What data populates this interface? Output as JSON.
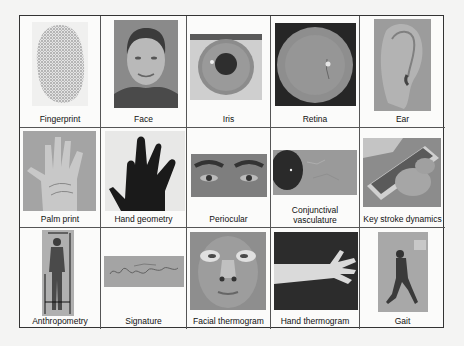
{
  "figure": {
    "type": "biometric-traits-grid",
    "rows": 3,
    "columns": 5,
    "cells": [
      {
        "label": "Fingerprint",
        "icon": "fingerprint-image"
      },
      {
        "label": "Face",
        "icon": "face-image"
      },
      {
        "label": "Iris",
        "icon": "iris-image"
      },
      {
        "label": "Retina",
        "icon": "retina-image"
      },
      {
        "label": "Ear",
        "icon": "ear-image"
      },
      {
        "label": "Palm print",
        "icon": "palm-print-image"
      },
      {
        "label": "Hand geometry",
        "icon": "hand-geometry-image"
      },
      {
        "label": "Periocular",
        "icon": "periocular-image"
      },
      {
        "label": "Conjunctival",
        "label2": "vasculature",
        "icon": "conjunctival-vasculature-image"
      },
      {
        "label": "Key stroke dynamics",
        "icon": "keystroke-dynamics-image"
      },
      {
        "label": "Anthropometry",
        "icon": "anthropometry-image"
      },
      {
        "label": "Signature",
        "icon": "signature-image"
      },
      {
        "label": "Facial thermogram",
        "icon": "facial-thermogram-image"
      },
      {
        "label": "Hand thermogram",
        "icon": "hand-thermogram-image"
      },
      {
        "label": "Gait",
        "icon": "gait-image"
      }
    ]
  },
  "colors": {
    "background": "#f4f4f3",
    "border": "#333333",
    "text": "#111111"
  }
}
